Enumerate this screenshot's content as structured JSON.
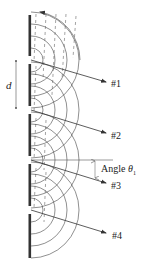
{
  "diagram": {
    "slit_spacing_label": "d",
    "angle_label": {
      "prefix": "Angle",
      "symbol": "θ",
      "subscript": "1"
    },
    "rays": [
      {
        "label": "#1",
        "from": [
          31,
          60
        ],
        "to": [
          106,
          82
        ]
      },
      {
        "label": "#2",
        "from": [
          31,
          110
        ],
        "to": [
          106,
          133
        ]
      },
      {
        "label": "#3",
        "from": [
          31,
          160
        ],
        "to": [
          106,
          183
        ]
      },
      {
        "label": "#4",
        "from": [
          31,
          210
        ],
        "to": [
          106,
          233
        ]
      }
    ],
    "slits_y": [
      60,
      110,
      160,
      210
    ],
    "barriers": [
      {
        "y1": 15,
        "y2": 56
      },
      {
        "y1": 64,
        "y2": 106
      },
      {
        "y1": 114,
        "y2": 156
      },
      {
        "y1": 164,
        "y2": 206
      },
      {
        "y1": 214,
        "y2": 258
      }
    ],
    "colors": {
      "barrier": "#333333",
      "wave": "#444444",
      "ray": "#333333",
      "text": "#222222"
    }
  }
}
